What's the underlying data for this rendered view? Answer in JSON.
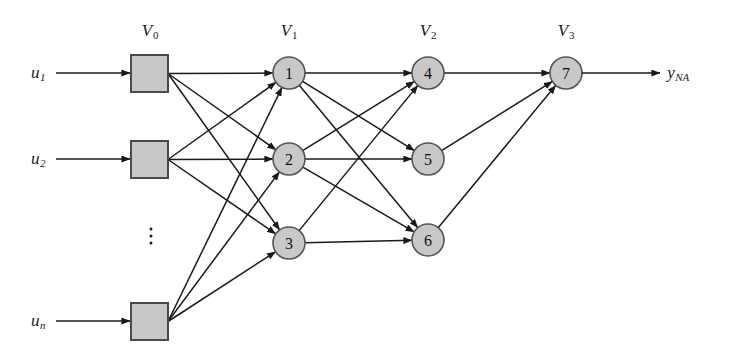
{
  "figure": {
    "width": 732,
    "height": 361,
    "background": "#ffffff",
    "stroke_color": "#1a1a1a",
    "node_fill": "#c8c8c8",
    "node_stroke": "#555555",
    "box_fill": "#c8c8c8",
    "box_stroke": "#4a4a4a"
  },
  "layer_labels": [
    {
      "id": "V0",
      "text": "V",
      "sub": "0",
      "x": 150,
      "y": 31
    },
    {
      "id": "V1",
      "text": "V",
      "sub": "1",
      "x": 289,
      "y": 31
    },
    {
      "id": "V2",
      "text": "V",
      "sub": "2",
      "x": 428,
      "y": 31
    },
    {
      "id": "V3",
      "text": "V",
      "sub": "3",
      "x": 566,
      "y": 31
    }
  ],
  "inputs": [
    {
      "id": "u1",
      "text": "u",
      "sub": "1",
      "label_x": 38,
      "label_y": 73,
      "arrow_from_x": 56,
      "arrow_to_x": 130,
      "y": 73
    },
    {
      "id": "u2",
      "text": "u",
      "sub": "2",
      "label_x": 38,
      "label_y": 159,
      "arrow_from_x": 56,
      "arrow_to_x": 130,
      "y": 159
    },
    {
      "id": "un",
      "text": "u",
      "sub": "n",
      "label_x": 38,
      "label_y": 321,
      "arrow_from_x": 56,
      "arrow_to_x": 130,
      "y": 321
    }
  ],
  "input_boxes": [
    {
      "id": "box-1",
      "x": 131,
      "y": 55,
      "w": 37,
      "h": 37
    },
    {
      "id": "box-2",
      "x": 131,
      "y": 141,
      "w": 37,
      "h": 37
    },
    {
      "id": "box-n",
      "x": 131,
      "y": 303,
      "w": 37,
      "h": 37
    }
  ],
  "input_ellipsis": {
    "x": 151,
    "y": 236
  },
  "nodes": [
    {
      "id": "n1",
      "label": "1",
      "cx": 289,
      "cy": 73,
      "r": 16,
      "layer": "V1"
    },
    {
      "id": "n2",
      "label": "2",
      "cx": 289,
      "cy": 159,
      "r": 16,
      "layer": "V1"
    },
    {
      "id": "n3",
      "label": "3",
      "cx": 289,
      "cy": 243,
      "r": 16,
      "layer": "V1"
    },
    {
      "id": "n4",
      "label": "4",
      "cx": 428,
      "cy": 73,
      "r": 16,
      "layer": "V2"
    },
    {
      "id": "n5",
      "label": "5",
      "cx": 428,
      "cy": 159,
      "r": 16,
      "layer": "V2"
    },
    {
      "id": "n6",
      "label": "6",
      "cx": 428,
      "cy": 240,
      "r": 16,
      "layer": "V2"
    },
    {
      "id": "n7",
      "label": "7",
      "cx": 566,
      "cy": 73,
      "r": 16,
      "layer": "V3"
    }
  ],
  "output": {
    "id": "yNA",
    "text": "y",
    "sub": "NA",
    "label_x": 678,
    "label_y": 73,
    "arrow_from_x": 582,
    "arrow_to_x": 660,
    "y": 73
  },
  "edges": [
    {
      "from": "box-1",
      "to": "n1"
    },
    {
      "from": "box-1",
      "to": "n2"
    },
    {
      "from": "box-1",
      "to": "n3"
    },
    {
      "from": "box-2",
      "to": "n1"
    },
    {
      "from": "box-2",
      "to": "n2"
    },
    {
      "from": "box-2",
      "to": "n3"
    },
    {
      "from": "box-n",
      "to": "n1"
    },
    {
      "from": "box-n",
      "to": "n2"
    },
    {
      "from": "box-n",
      "to": "n3"
    },
    {
      "from": "n1",
      "to": "n4"
    },
    {
      "from": "n1",
      "to": "n5"
    },
    {
      "from": "n1",
      "to": "n6"
    },
    {
      "from": "n2",
      "to": "n4"
    },
    {
      "from": "n2",
      "to": "n5"
    },
    {
      "from": "n2",
      "to": "n6"
    },
    {
      "from": "n3",
      "to": "n4"
    },
    {
      "from": "n3",
      "to": "n6"
    },
    {
      "from": "n4",
      "to": "n7"
    },
    {
      "from": "n5",
      "to": "n7"
    },
    {
      "from": "n6",
      "to": "n7"
    }
  ]
}
